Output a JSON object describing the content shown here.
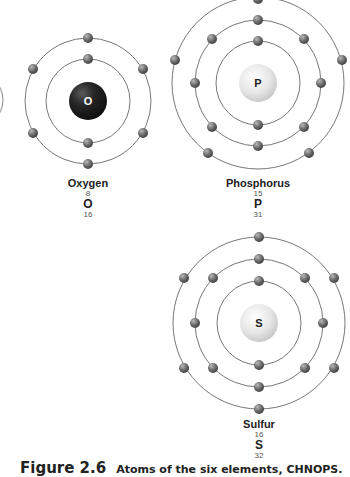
{
  "atoms": [
    {
      "name": "Oxygen",
      "symbol": "O",
      "atomic_number": "8",
      "mass_number": "16",
      "shells": [
        2,
        6
      ],
      "nucleus_color": "#2a2a2a"
    },
    {
      "name": "Phosphorus",
      "symbol": "P",
      "atomic_number": "15",
      "mass_number": "31",
      "shells": [
        2,
        8,
        5
      ],
      "nucleus_color": "#e4e4e4"
    },
    {
      "name": "Sulfur",
      "symbol": "S",
      "atomic_number": "16",
      "mass_number": "32",
      "shells": [
        2,
        8,
        6
      ],
      "nucleus_color": "#e4e4e4"
    }
  ],
  "caption": {
    "figure": "Figure 2.6",
    "text": "Atoms of the six elements, CHNOPS."
  },
  "colors": {
    "orbit": "#777777",
    "electron": "#666666"
  }
}
